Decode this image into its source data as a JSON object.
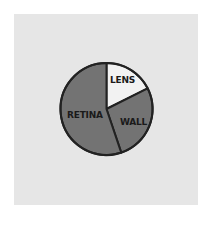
{
  "chart_data": {
    "type": "pie",
    "title": "",
    "categories": [
      "LENS",
      "WALL",
      "RETINA"
    ],
    "values": [
      17.6,
      27.2,
      55.2
    ],
    "start_angle_deg": 0,
    "direction": "clockwise",
    "colors": [
      "#f2f2f2",
      "#737373",
      "#737373"
    ],
    "outline_color": "#222222",
    "legend": "none (labels drawn inside slices)"
  },
  "labels": {
    "lens": "LENS",
    "wall": "WALL",
    "retina": "RETINA"
  },
  "colors": {
    "page_background": "#ffffff",
    "card_background": "#e6e6e6"
  }
}
